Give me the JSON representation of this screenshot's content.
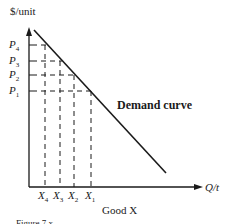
{
  "figure": {
    "y_axis_label": "$/unit",
    "x_axis_label": "Q/t",
    "good_label": "Good X",
    "curve_label": "Demand curve",
    "caption_partial": "Figure 7.x"
  },
  "prices": [
    {
      "base": "P",
      "sub": "4"
    },
    {
      "base": "P",
      "sub": "3"
    },
    {
      "base": "P",
      "sub": "2"
    },
    {
      "base": "P",
      "sub": "1"
    }
  ],
  "quantities": [
    {
      "base": "X",
      "sub": "4"
    },
    {
      "base": "X",
      "sub": "3"
    },
    {
      "base": "X",
      "sub": "2"
    },
    {
      "base": "X",
      "sub": "1"
    }
  ],
  "colors": {
    "ink": "#1a1a1a",
    "background": "#ffffff"
  }
}
